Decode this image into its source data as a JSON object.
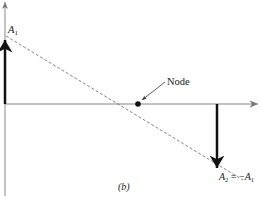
{
  "diagram": {
    "caption": "(b)",
    "node_label": "Node",
    "amplitude_1": {
      "symbol": "A",
      "subscript": "1"
    },
    "amplitude_2": {
      "symbol": "A",
      "subscript": "2",
      "equals": " = −",
      "rhs_symbol": "A",
      "rhs_subscript": "1"
    },
    "colors": {
      "axis": "#888888",
      "arrow": "#111111",
      "dashed": "#666666",
      "node": "#111111",
      "background": "#ffffff"
    }
  }
}
